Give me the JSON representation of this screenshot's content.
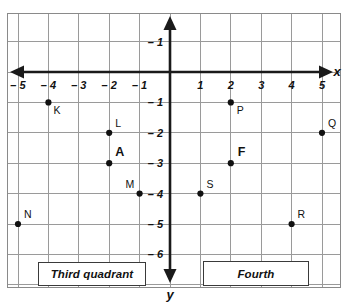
{
  "chart_data": {
    "type": "scatter",
    "title": "",
    "xlabel": "x",
    "ylabel": "y",
    "grid": true,
    "legend": "none",
    "xlim": [
      -5.5,
      5.5
    ],
    "ylim": [
      -6.5,
      1.5
    ],
    "x_ticks": [
      "-5",
      "-4",
      "-3",
      "-2",
      "-1",
      "1",
      "2",
      "3",
      "4",
      "5"
    ],
    "x_tick_values": [
      -5,
      -4,
      -3,
      -2,
      -1,
      1,
      2,
      3,
      4,
      5
    ],
    "y_ticks": [
      "-1",
      "-1",
      "-2",
      "-3",
      "-4",
      "-5",
      "-6"
    ],
    "y_tick_values": [
      1,
      -1,
      -2,
      -3,
      -4,
      -5,
      -6
    ],
    "points": [
      {
        "label": "K",
        "x": -4,
        "y": -1,
        "bold": false,
        "label_dx": 5,
        "label_dy": 12
      },
      {
        "label": "L",
        "x": -2,
        "y": -2,
        "bold": false,
        "label_dx": 6,
        "label_dy": -6
      },
      {
        "label": "A",
        "x": -2,
        "y": -3,
        "bold": true,
        "label_dx": 6,
        "label_dy": -7
      },
      {
        "label": "M",
        "x": -1,
        "y": -4,
        "bold": false,
        "label_dx": -14,
        "label_dy": -6
      },
      {
        "label": "N",
        "x": -5,
        "y": -5,
        "bold": false,
        "label_dx": 6,
        "label_dy": -6
      },
      {
        "label": "P",
        "x": 2,
        "y": -1,
        "bold": false,
        "label_dx": 6,
        "label_dy": 12
      },
      {
        "label": "Q",
        "x": 5,
        "y": -2,
        "bold": false,
        "label_dx": 6,
        "label_dy": -6
      },
      {
        "label": "F",
        "x": 2,
        "y": -3,
        "bold": true,
        "label_dx": 7,
        "label_dy": -7
      },
      {
        "label": "S",
        "x": 1,
        "y": -4,
        "bold": false,
        "label_dx": 6,
        "label_dy": -6
      },
      {
        "label": "R",
        "x": 4,
        "y": -5,
        "bold": false,
        "label_dx": 6,
        "label_dy": -6
      }
    ],
    "annotations": [
      {
        "name": "third-quadrant",
        "text": "Third quadrant"
      },
      {
        "name": "fourth-quadrant",
        "text": "Fourth"
      }
    ]
  },
  "axes": {
    "x_label": "x",
    "y_label": "y"
  },
  "callouts": {
    "third": "Third quadrant",
    "fourth": "Fourth"
  },
  "colors": {
    "grid": "#9a9a9a",
    "axis": "#1a1a1a",
    "point": "#111111",
    "box_border": "#3a3a3a",
    "background": "#ffffff"
  }
}
